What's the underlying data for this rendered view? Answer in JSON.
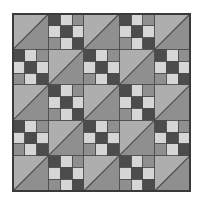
{
  "figure": {
    "canvas_width": 202,
    "canvas_height": 217,
    "background_color": "#ffffff"
  },
  "quilt": {
    "origin_x": 13,
    "origin_y": 14,
    "size": 177,
    "grid_rows": 5,
    "grid_cols": 5,
    "block_size": 35.4,
    "border_color": "#3a3a3a",
    "border_width": 1.6,
    "seam_color": "#4a4a4a",
    "seam_width": 0.9
  },
  "palette": {
    "dark_gray": "#4c4c4c",
    "mid_gray": "#8f8f8f",
    "light_gray": "#aeaeae",
    "pale_gray": "#d6d6d6",
    "near_white": "#e8e8e8",
    "outline": "#3a3a3a"
  },
  "blocks": {
    "triangle": {
      "name": "half-square-triangle",
      "upper_left_color": "#aeaeae",
      "lower_right_color": "#8f8f8f",
      "diagonal_color": "#4a4a4a",
      "diagonal_direction": "bottom-left-to-top-right"
    },
    "nine_patch": {
      "name": "nine-patch",
      "cells": [
        [
          "#4c4c4c",
          "#d6d6d6",
          "#8f8f8f"
        ],
        [
          "#d6d6d6",
          "#4c4c4c",
          "#d6d6d6"
        ],
        [
          "#8f8f8f",
          "#d6d6d6",
          "#4c4c4c"
        ]
      ]
    }
  },
  "layout": {
    "legend": "T = triangle block, N = nine-patch block",
    "rows": [
      [
        "T",
        "N",
        "T",
        "N",
        "T"
      ],
      [
        "N",
        "T",
        "N",
        "T",
        "N"
      ],
      [
        "T",
        "N",
        "T",
        "N",
        "T"
      ],
      [
        "N",
        "T",
        "N",
        "T",
        "N"
      ],
      [
        "T",
        "N",
        "T",
        "N",
        "T"
      ]
    ]
  }
}
